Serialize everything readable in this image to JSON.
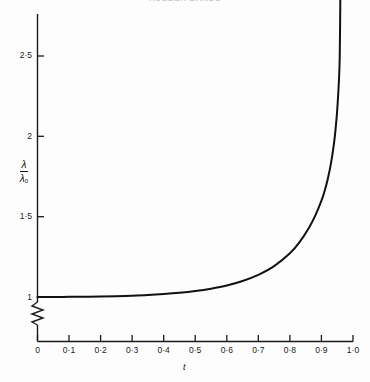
{
  "figure": {
    "title": "RUBBER BANDS",
    "background_color": "#fdfdfd",
    "line_color": "#111111",
    "axis_color": "#1a1a1a"
  },
  "axes": {
    "y": {
      "label_numerator": "λ",
      "label_denominator": "λ",
      "label_denominator_sub": "0",
      "ticks": [
        {
          "value": 1,
          "label": "1"
        },
        {
          "value": 1.5,
          "label": "1·5"
        },
        {
          "value": 2,
          "label": "2"
        },
        {
          "value": 2.5,
          "label": "2·5"
        }
      ],
      "range": [
        1.0,
        2.9
      ],
      "axis_break": true,
      "axis_break_note": "zigzag break between 0 and 1"
    },
    "x": {
      "label": "t",
      "ticks": [
        {
          "value": 0.0,
          "label": "0"
        },
        {
          "value": 0.1,
          "label": "0·1"
        },
        {
          "value": 0.2,
          "label": "0·2"
        },
        {
          "value": 0.3,
          "label": "0·3"
        },
        {
          "value": 0.4,
          "label": "0·4"
        },
        {
          "value": 0.5,
          "label": "0·5"
        },
        {
          "value": 0.6,
          "label": "0·6"
        },
        {
          "value": 0.7,
          "label": "0·7"
        },
        {
          "value": 0.8,
          "label": "0·8"
        },
        {
          "value": 0.9,
          "label": "0·9"
        },
        {
          "value": 1.0,
          "label": "1·0"
        }
      ],
      "range": [
        0.0,
        1.0
      ]
    }
  },
  "chart_data": {
    "type": "line",
    "title": "RUBBER BANDS",
    "xlabel": "t",
    "ylabel": "λ/λ₀",
    "xlim": [
      0.0,
      1.0
    ],
    "ylim": [
      1.0,
      2.9
    ],
    "grid": false,
    "legend": "none",
    "asymptote_x": 0.96,
    "series": [
      {
        "name": "λ/λ₀ vs t",
        "x": [
          0.0,
          0.05,
          0.1,
          0.15,
          0.2,
          0.25,
          0.3,
          0.35,
          0.4,
          0.45,
          0.5,
          0.55,
          0.6,
          0.65,
          0.7,
          0.75,
          0.8,
          0.83,
          0.86,
          0.88,
          0.9,
          0.91,
          0.92,
          0.93,
          0.94,
          0.945,
          0.95,
          0.955,
          0.958,
          0.96
        ],
        "y": [
          1.0,
          1.0,
          1.001,
          1.002,
          1.003,
          1.005,
          1.008,
          1.012,
          1.018,
          1.026,
          1.037,
          1.052,
          1.072,
          1.1,
          1.138,
          1.192,
          1.272,
          1.34,
          1.43,
          1.505,
          1.6,
          1.66,
          1.735,
          1.83,
          1.96,
          2.05,
          2.165,
          2.33,
          2.5,
          2.9
        ]
      }
    ]
  }
}
